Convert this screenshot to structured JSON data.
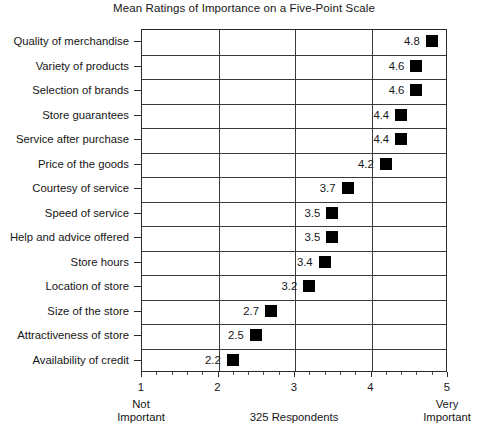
{
  "chart_data": {
    "type": "scatter",
    "title": "Mean Ratings of Importance on a Five-Point Scale",
    "xlabel": "325 Respondents",
    "ylabel": "",
    "xlim": [
      1,
      5
    ],
    "grid": "both",
    "legend": "none",
    "x_ticks": [
      "1",
      "2",
      "3",
      "4",
      "5"
    ],
    "x_tick_values": [
      1,
      2,
      3,
      4,
      5
    ],
    "x_minor_per_interval": 5,
    "categories": [
      "Quality of merchandise",
      "Variety of products",
      "Selection of brands",
      "Store guarantees",
      "Service after purchase",
      "Price of the goods",
      "Courtesy of service",
      "Speed of service",
      "Help and advice offered",
      "Store hours",
      "Location of store",
      "Size of the store",
      "Attractiveness of store",
      "Availability of credit"
    ],
    "values": [
      4.8,
      4.6,
      4.6,
      4.4,
      4.4,
      4.2,
      3.7,
      3.5,
      3.5,
      3.4,
      3.2,
      2.7,
      2.5,
      2.2
    ],
    "value_labels": [
      "4.8",
      "4.6",
      "4.6",
      "4.4",
      "4.4",
      "4.2",
      "3.7",
      "3.5",
      "3.5",
      "3.4",
      "3.2",
      "2.7",
      "2.5",
      "2.2"
    ],
    "marker_color": "#000000",
    "annotations": {
      "left_low": "Not",
      "left_low_2": "Important",
      "center": "325 Respondents",
      "right_high": "Very",
      "right_high_2": "Important"
    }
  }
}
